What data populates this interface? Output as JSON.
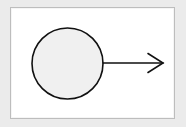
{
  "diagram": {
    "type": "circle-with-arrow",
    "colors": {
      "background": "#ebebeb",
      "frame_fill": "#ffffff",
      "frame_border": "#bdbdbd",
      "circle_fill": "#f0f0f0",
      "stroke": "#111111"
    },
    "nodes": [
      {
        "id": "circle",
        "shape": "circle",
        "label": ""
      }
    ],
    "edges": [
      {
        "from": "circle",
        "to": "right",
        "style": "open-arrowhead",
        "label": ""
      }
    ]
  }
}
